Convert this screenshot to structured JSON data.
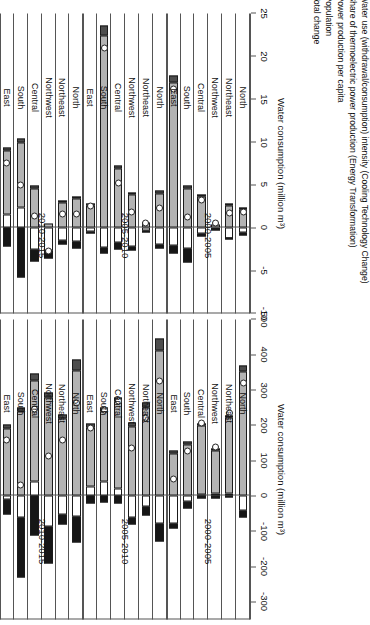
{
  "legend": {
    "items": [
      {
        "key": "water",
        "label": "Water use (withdrawal/consumption) intensity (Cooling Technology Change)",
        "color": "#ffffff"
      },
      {
        "key": "share",
        "label": "Share of thermoelectric power production (Energy Transformation)",
        "color": "#161616"
      },
      {
        "key": "power",
        "label": "Power production per capita",
        "color": "#b3b3b3"
      },
      {
        "key": "pop",
        "label": "Population",
        "color": "#4d4d4d"
      },
      {
        "key": "total",
        "label": "Total change",
        "color": "#ffffff"
      }
    ]
  },
  "chart_data": [
    {
      "id": "top",
      "type": "bar",
      "title": "",
      "subtype": "stacked-decomposition",
      "ylabel": "Water consumption (million m³)",
      "xlabel": "",
      "ylim": [
        -350,
        500
      ],
      "yticks": [
        500,
        400,
        300,
        200,
        100,
        0,
        -100,
        -200,
        -300
      ],
      "ytick_labels": [
        "500",
        "400",
        "300",
        "200",
        "100",
        "0",
        "-100",
        "-200",
        "-300"
      ],
      "grid": false,
      "legend_position": "right",
      "groups": [
        "2000-2005",
        "2005-2010",
        "2010-2015"
      ],
      "categories": [
        "North",
        "Northeast",
        "Northwest",
        "Central",
        "South",
        "East"
      ],
      "series": [
        {
          "name": "Water use (withdrawal/consumption) intensity (Cooling Technology Change)",
          "key": "water",
          "values": [
            -42,
            8,
            6,
            4,
            -16,
            -78,
            -78,
            -30,
            -62,
            22,
            40,
            26,
            -58,
            -52,
            -86,
            42,
            -62,
            -10
          ]
        },
        {
          "name": "Share of thermoelectric power production (Energy Transformation)",
          "key": "share",
          "values": [
            -18,
            -4,
            -6,
            -8,
            -20,
            -14,
            -52,
            -24,
            -20,
            -22,
            -18,
            -22,
            -74,
            -28,
            -104,
            -112,
            -170,
            -42
          ]
        },
        {
          "name": "Power production per capita",
          "key": "power",
          "values": [
            352,
            214,
            124,
            196,
            146,
            120,
            412,
            250,
            198,
            246,
            200,
            168,
            356,
            220,
            278,
            286,
            238,
            190
          ]
        },
        {
          "name": "Population",
          "key": "pop",
          "values": [
            18,
            6,
            4,
            6,
            8,
            10,
            34,
            14,
            10,
            12,
            12,
            12,
            30,
            10,
            16,
            20,
            14,
            12
          ]
        }
      ],
      "total_change": {
        "name": "Total change",
        "values": [
          310,
          224,
          128,
          198,
          118,
          38,
          316,
          210,
          126,
          258,
          234,
          184,
          254,
          150,
          104,
          236,
          20,
          150
        ]
      }
    },
    {
      "id": "bottom",
      "type": "bar",
      "title": "",
      "subtype": "stacked-decomposition",
      "ylabel": "Water consumption (million m³)",
      "xlabel": "",
      "ylim": [
        -10,
        25
      ],
      "yticks": [
        25,
        20,
        15,
        10,
        5,
        0,
        -5,
        -10
      ],
      "ytick_labels": [
        "25",
        "20",
        "15",
        "10",
        "5",
        "0",
        "-5",
        "-10"
      ],
      "grid": false,
      "legend_position": "right",
      "groups": [
        "2000-2005",
        "2005-2010",
        "2010-2015"
      ],
      "categories": [
        "North",
        "Northeast",
        "Northwest",
        "Central",
        "South",
        "East"
      ],
      "series": [
        {
          "name": "Water use (withdrawal/consumption) intensity (Cooling Technology Change)",
          "key": "water",
          "values": [
            -0.5,
            -1.3,
            -0.2,
            -0.7,
            -2.4,
            -2.1,
            -1.9,
            -0.3,
            -2.2,
            -1.7,
            -2.3,
            -0.4,
            -1.6,
            -1.5,
            -2.6,
            -2.5,
            2.4,
            1.6
          ]
        },
        {
          "name": "Share of thermoelectric power production (Energy Transformation)",
          "key": "share",
          "values": [
            -0.4,
            -0.1,
            -0.1,
            -0.3,
            -1.6,
            -0.9,
            -0.5,
            -0.2,
            -0.5,
            -0.8,
            -0.7,
            -0.3,
            -0.8,
            -0.4,
            -1.0,
            -1.4,
            -5.8,
            -2.2
          ]
        },
        {
          "name": "Power production per capita",
          "key": "power",
          "values": [
            2.1,
            2.6,
            0.4,
            3.6,
            4.6,
            16.9,
            4.0,
            0.6,
            3.9,
            6.9,
            22.4,
            2.6,
            3.4,
            3.0,
            0.5,
            4.6,
            7.6,
            7.4
          ]
        },
        {
          "name": "Population",
          "key": "pop",
          "values": [
            0.2,
            0.1,
            0.0,
            0.2,
            0.3,
            0.9,
            0.3,
            0.0,
            0.2,
            0.4,
            1.2,
            0.2,
            0.2,
            0.1,
            0.0,
            0.3,
            0.4,
            0.4
          ]
        }
      ],
      "total_change": {
        "name": "Total change",
        "values": [
          1.4,
          1.3,
          0.1,
          2.8,
          0.9,
          15.8,
          1.9,
          0.1,
          1.4,
          4.8,
          20.6,
          2.1,
          1.2,
          1.2,
          -3.1,
          1.0,
          4.6,
          7.2
        ]
      }
    }
  ]
}
